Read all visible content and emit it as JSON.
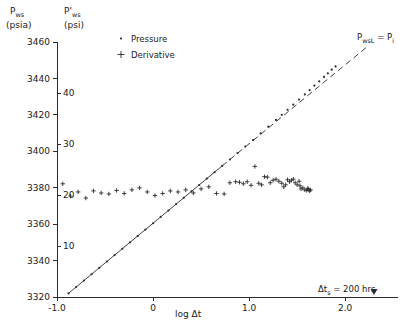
{
  "figure": {
    "background": "#ffffff",
    "ink_color": "#2b2b2b"
  },
  "axes": {
    "left": {
      "title": "P",
      "title_sub": "ws",
      "unit": "(psia)",
      "ticks": [
        "3320",
        "3340",
        "3360",
        "3380",
        "3400",
        "3420",
        "3440",
        "3460"
      ],
      "min": 3320,
      "max": 3460
    },
    "right": {
      "title": "P'",
      "title_sub": "ws",
      "unit": "(psi)",
      "ticks": [
        "10",
        "20",
        "30",
        "40"
      ],
      "tick_values": [
        10,
        20,
        30,
        40
      ],
      "min": 0,
      "max": 50
    },
    "x": {
      "label": "log Δt",
      "ticks": [
        "-1.0",
        "0",
        "1.0",
        "2.0"
      ],
      "tick_values": [
        -1.0,
        0,
        1.0,
        2.0
      ],
      "min": -1.0,
      "max": 2.55
    }
  },
  "legend": {
    "items": [
      {
        "marker": "dot",
        "label": "Pressure"
      },
      {
        "marker": "plus",
        "label": "Derivative"
      }
    ]
  },
  "annotations": {
    "line_label": {
      "text": "P",
      "sub": "wsL",
      "eq": " = P",
      "sub2": "i"
    },
    "shutin": {
      "text": "Δt",
      "sub": "s",
      "rest": " = 200 hrs",
      "x_value": 2.3
    }
  },
  "chart_data": {
    "type": "scatter",
    "title": "",
    "xlabel": "log Δt",
    "ylabel": "P_ws (psia)",
    "ylabel_right": "P'_ws (psi)",
    "xlim": [
      -1.0,
      2.55
    ],
    "ylim": [
      3320,
      3460
    ],
    "ylim_right": [
      0,
      50
    ],
    "grid": false,
    "legend_position": "top-left",
    "series": [
      {
        "name": "Pressure",
        "marker": "dot",
        "axis": "left",
        "x": [
          -0.88,
          -0.8,
          -0.72,
          -0.64,
          -0.56,
          -0.48,
          -0.4,
          -0.32,
          -0.24,
          -0.16,
          -0.08,
          0.0,
          0.08,
          0.16,
          0.24,
          0.32,
          0.4,
          0.48,
          0.56,
          0.64,
          0.72,
          0.8,
          0.88,
          0.96,
          1.04,
          1.12,
          1.2,
          1.28,
          1.34,
          1.4,
          1.46,
          1.52,
          1.58,
          1.63,
          1.68,
          1.73,
          1.78,
          1.82,
          1.86,
          1.9
        ],
        "y": [
          3322.0,
          3325.5,
          3329.0,
          3332.5,
          3336.0,
          3339.5,
          3343.0,
          3346.5,
          3350.0,
          3353.5,
          3357.0,
          3360.5,
          3364.0,
          3367.5,
          3371.0,
          3374.5,
          3378.0,
          3381.5,
          3385.0,
          3388.5,
          3392.0,
          3395.5,
          3399.0,
          3402.6,
          3406.2,
          3409.8,
          3413.5,
          3417.2,
          3420.0,
          3422.8,
          3425.6,
          3428.4,
          3431.2,
          3433.6,
          3436.0,
          3438.4,
          3440.8,
          3442.8,
          3444.8,
          3446.6
        ]
      },
      {
        "name": "Derivative",
        "marker": "plus",
        "axis": "right",
        "x": [
          -0.94,
          -0.86,
          -0.78,
          -0.7,
          -0.62,
          -0.54,
          -0.46,
          -0.38,
          -0.3,
          -0.22,
          -0.14,
          -0.06,
          0.02,
          0.1,
          0.18,
          0.26,
          0.34,
          0.42,
          0.5,
          0.58,
          0.66,
          0.74,
          0.8,
          0.86,
          0.9,
          0.94,
          0.98,
          1.02,
          1.06,
          1.1,
          1.13,
          1.16,
          1.19,
          1.22,
          1.25,
          1.28,
          1.31,
          1.34,
          1.36,
          1.38,
          1.4,
          1.42,
          1.44,
          1.46,
          1.48,
          1.5,
          1.52,
          1.53,
          1.54,
          1.56,
          1.58,
          1.6,
          1.61,
          1.62,
          1.63,
          1.64
        ],
        "y": [
          22.2,
          19.8,
          20.6,
          19.4,
          20.8,
          20.4,
          20.2,
          20.9,
          20.3,
          21.0,
          21.4,
          20.6,
          19.9,
          20.3,
          20.8,
          20.6,
          21.0,
          20.4,
          21.2,
          21.6,
          20.3,
          20.2,
          22.4,
          22.6,
          22.5,
          22.2,
          22.6,
          21.9,
          25.6,
          22.3,
          22.0,
          23.6,
          23.5,
          22.4,
          22.9,
          23.1,
          22.7,
          22.3,
          21.6,
          22.0,
          23.0,
          22.6,
          22.9,
          23.1,
          22.4,
          22.0,
          22.7,
          21.8,
          21.2,
          21.4,
          21.0,
          20.9,
          21.3,
          21.1,
          20.8,
          21.0
        ]
      }
    ],
    "lines": [
      {
        "name": "semilog-straight-line",
        "style": "solid",
        "x": [
          -0.88,
          0.72
        ],
        "y": [
          3322.0,
          3392.0
        ]
      },
      {
        "name": "extrapolated-line-to-Pi",
        "style": "dashed",
        "x": [
          0.72,
          2.22
        ],
        "y": [
          3392.0,
          3457.0
        ]
      }
    ]
  }
}
